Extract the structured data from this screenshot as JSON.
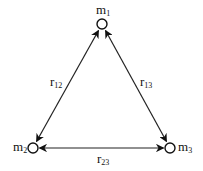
{
  "diagram": {
    "nodes": [
      {
        "id": "m1",
        "label": "m",
        "sub": "1",
        "x": 102,
        "y": 24
      },
      {
        "id": "m2",
        "label": "m",
        "sub": "2",
        "x": 33,
        "y": 148
      },
      {
        "id": "m3",
        "label": "m",
        "sub": "3",
        "x": 170,
        "y": 148
      }
    ],
    "edges": [
      {
        "from": "m1",
        "to": "m2",
        "label": "r",
        "sub": "12",
        "style": "double-arrow"
      },
      {
        "from": "m1",
        "to": "m3",
        "label": "r",
        "sub": "13",
        "style": "double-arrow"
      },
      {
        "from": "m2",
        "to": "m3",
        "label": "r",
        "sub": "23",
        "style": "double-arrow"
      }
    ],
    "colors": {
      "stroke": "#222222",
      "node_fill": "#ffffff",
      "text": "#111111"
    }
  }
}
